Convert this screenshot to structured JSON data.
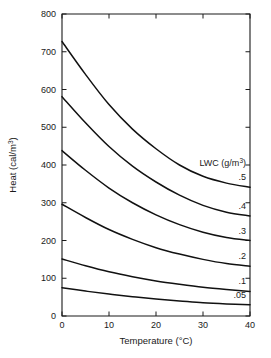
{
  "chart_data": {
    "type": "line",
    "title": "",
    "xlabel": "Temperature (°C)",
    "ylabel": "Heat (cal/m³)",
    "xlim": [
      0,
      40
    ],
    "ylim": [
      0,
      800
    ],
    "xticks": [
      0,
      10,
      20,
      30,
      40
    ],
    "yticks": [
      0,
      100,
      200,
      300,
      400,
      500,
      600,
      700,
      800
    ],
    "xtick_labels": [
      "0",
      "10",
      "20",
      "30",
      "40"
    ],
    "ytick_labels": [
      "0",
      "100",
      "200",
      "300",
      "400",
      "500",
      "600",
      "700",
      "800"
    ],
    "grid": false,
    "legend_position": "inline-right-end-labels",
    "legend_title": "LWC (g/m³)",
    "legend_title_parts": {
      "name": "LWC (g/m",
      "sup": "3",
      "close": ")"
    },
    "ylabel_parts": {
      "name": "Heat (cal/m",
      "sup": "3",
      "close": ")"
    },
    "x": [
      0,
      5,
      10,
      15,
      20,
      25,
      30,
      35,
      40
    ],
    "series": [
      {
        "name": ".5",
        "label": ".5",
        "values": [
          727,
          640,
          560,
          495,
          443,
          400,
          370,
          352,
          341
        ]
      },
      {
        "name": ".4",
        "label": ".4",
        "values": [
          581,
          512,
          449,
          397,
          355,
          320,
          293,
          275,
          265
        ]
      },
      {
        "name": ".3",
        "label": ".3",
        "values": [
          438,
          386,
          339,
          300,
          268,
          242,
          222,
          208,
          200
        ]
      },
      {
        "name": ".2",
        "label": ".2",
        "values": [
          296,
          261,
          229,
          203,
          181,
          164,
          150,
          139,
          132
        ]
      },
      {
        "name": ".1",
        "label": ".1",
        "values": [
          151,
          133,
          117,
          104,
          93,
          84,
          76,
          70,
          65
        ]
      },
      {
        "name": ".05",
        "label": ".05",
        "values": [
          75,
          66,
          58,
          51,
          45,
          40,
          35,
          32,
          30
        ]
      }
    ]
  }
}
